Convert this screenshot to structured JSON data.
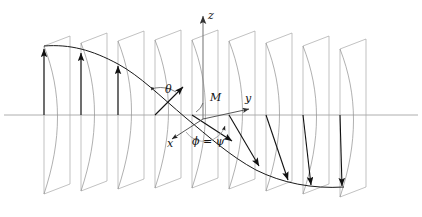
{
  "figure": {
    "axes": {
      "z": {
        "label": "z",
        "icon": "axis-arrow-up-icon"
      },
      "y": {
        "label": "y",
        "icon": "axis-arrow-right-icon"
      },
      "x": {
        "label": "x",
        "icon": "axis-arrow-downleft-icon"
      }
    },
    "points": {
      "M": {
        "label": "M"
      }
    },
    "angles": {
      "theta": {
        "label": "θ"
      },
      "phi_psi": {
        "label": "ϕ = ψ"
      }
    },
    "colors": {
      "plane_stroke": "#a8a8a8",
      "arc_stroke": "#8e8e8e",
      "curve_stroke": "#1a1a1a",
      "vector_stroke": "#111111",
      "axis_stroke": "#9a9a9a",
      "background": "#ffffff",
      "label_fill": "#111111"
    },
    "geometry": {
      "horizontal_axis_y": 115,
      "plane_count": 9,
      "plane_x_positions": [
        44,
        81,
        118,
        155,
        192,
        229,
        266,
        303,
        340
      ],
      "plane_top_y": [
        46,
        43,
        41,
        40,
        40,
        41,
        43,
        46,
        49
      ],
      "plane_height": 148,
      "plane_skew_dx": 26,
      "plane_skew_dy": -10,
      "vector_tip_y": [
        48,
        60,
        78,
        100,
        126,
        150,
        168,
        180,
        185
      ],
      "curve_label": "precession-curve"
    }
  }
}
